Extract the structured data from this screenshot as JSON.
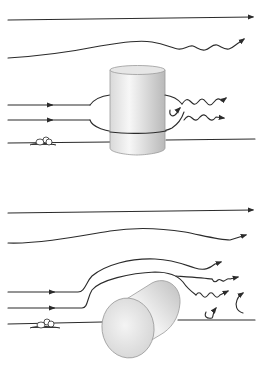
{
  "diagram": {
    "description": "Airflow around obstacles: upright cylinder (top) versus tilted/fallen cylinder (bottom), with smooth streamlines above and turbulent wakes behind.",
    "colors": {
      "stroke": "#2b2b2b",
      "cylinder_light": "#f2f2f2",
      "cylinder_shade": "#bdbdbd",
      "background": "#ffffff"
    },
    "panels": [
      {
        "id": "top",
        "label": "Upright cylinder",
        "elements": [
          "straight-streamline",
          "wavy-streamline",
          "split-flow-around-cylinder",
          "turbulent-wake",
          "eddy",
          "ground-line",
          "ground-tuft"
        ]
      },
      {
        "id": "bottom",
        "label": "Fallen cylinder",
        "elements": [
          "straight-streamline",
          "curved-streamline",
          "flow-over-cylinder",
          "turbulent-wake",
          "eddies",
          "ground-line",
          "ground-tuft"
        ]
      }
    ]
  }
}
